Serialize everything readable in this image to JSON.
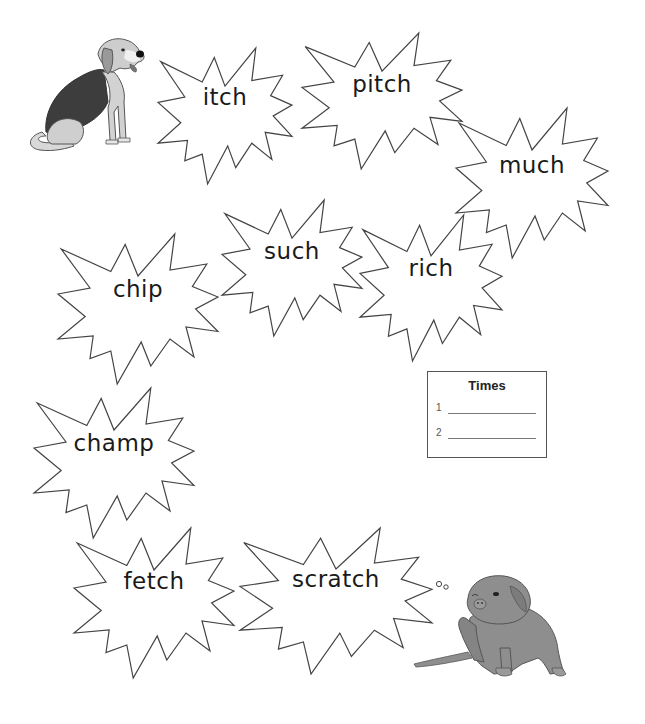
{
  "worksheet": {
    "bursts": [
      {
        "word": "itch",
        "x": 158,
        "y": 48,
        "w": 134,
        "h": 136,
        "text_y": 50
      },
      {
        "word": "pitch",
        "x": 302,
        "y": 33,
        "w": 160,
        "h": 136,
        "text_y": 52
      },
      {
        "word": "much",
        "x": 456,
        "y": 108,
        "w": 152,
        "h": 150,
        "text_y": 58
      },
      {
        "word": "such",
        "x": 222,
        "y": 200,
        "w": 140,
        "h": 136,
        "text_y": 52
      },
      {
        "word": "rich",
        "x": 360,
        "y": 215,
        "w": 142,
        "h": 146,
        "text_y": 54
      },
      {
        "word": "chip",
        "x": 58,
        "y": 234,
        "w": 160,
        "h": 150,
        "text_y": 56
      },
      {
        "word": "champ",
        "x": 34,
        "y": 388,
        "w": 160,
        "h": 150,
        "text_y": 56
      },
      {
        "word": "fetch",
        "x": 74,
        "y": 528,
        "w": 160,
        "h": 150,
        "text_y": 54
      },
      {
        "word": "scratch",
        "x": 240,
        "y": 528,
        "w": 192,
        "h": 146,
        "text_y": 52
      }
    ],
    "times_box": {
      "title": "Times",
      "rows": [
        {
          "num": "1"
        },
        {
          "num": "2"
        }
      ]
    },
    "images": {
      "top_dog": "beagle-sitting-illustration",
      "bottom_dog": "dog-scratching-illustration"
    },
    "colors": {
      "outline": "#444444",
      "text": "#1a1a1a",
      "dog_gray": "#8c8c8c",
      "dog_dark": "#3a3a3a"
    }
  }
}
